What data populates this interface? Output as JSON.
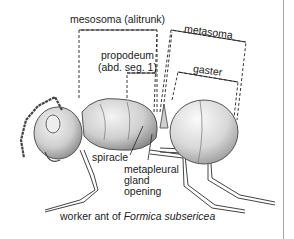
{
  "diagram": {
    "labels": {
      "mesosoma": "mesosoma (alitrunk)",
      "propodeum_line1": "propodeum",
      "propodeum_line2": "(abd. seg. 1)",
      "metasoma": "metasoma",
      "gaster": "gaster",
      "spiracle": "spiracle",
      "metapleural_line1": "metapleural",
      "metapleural_line2": "gland",
      "metapleural_line3": "opening"
    },
    "caption": {
      "prefix": "worker ant of ",
      "species": "Formica subsericea"
    }
  }
}
